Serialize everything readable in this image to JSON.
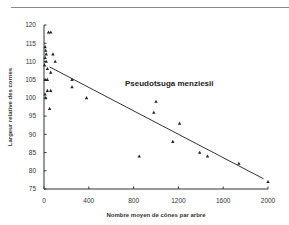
{
  "chart_data": {
    "type": "scatter",
    "title": "Pseudotsuga menziesii",
    "xlabel": "Nombre moyen de cônes par arbre",
    "ylabel": "Largeur relative des cornes",
    "xlim": [
      0,
      2000
    ],
    "ylim": [
      75,
      120
    ],
    "xticks": [
      0,
      400,
      800,
      1200,
      1600,
      2000
    ],
    "yticks": [
      75,
      80,
      85,
      90,
      95,
      100,
      105,
      110,
      115,
      120
    ],
    "grid": false,
    "legend": null,
    "marker": "triangle",
    "points": [
      {
        "x": 40,
        "y": 118
      },
      {
        "x": 60,
        "y": 118
      },
      {
        "x": 10,
        "y": 114
      },
      {
        "x": 15,
        "y": 113
      },
      {
        "x": 20,
        "y": 112
      },
      {
        "x": 10,
        "y": 111
      },
      {
        "x": 20,
        "y": 110
      },
      {
        "x": 5,
        "y": 109
      },
      {
        "x": 80,
        "y": 112
      },
      {
        "x": 100,
        "y": 110
      },
      {
        "x": 30,
        "y": 108
      },
      {
        "x": 60,
        "y": 107
      },
      {
        "x": 10,
        "y": 105
      },
      {
        "x": 30,
        "y": 105
      },
      {
        "x": 30,
        "y": 102
      },
      {
        "x": 60,
        "y": 102
      },
      {
        "x": 10,
        "y": 101
      },
      {
        "x": 15,
        "y": 100
      },
      {
        "x": 50,
        "y": 97
      },
      {
        "x": 250,
        "y": 105
      },
      {
        "x": 250,
        "y": 103
      },
      {
        "x": 380,
        "y": 100
      },
      {
        "x": 850,
        "y": 84
      },
      {
        "x": 980,
        "y": 96
      },
      {
        "x": 1000,
        "y": 99
      },
      {
        "x": 1150,
        "y": 88
      },
      {
        "x": 1210,
        "y": 93
      },
      {
        "x": 1390,
        "y": 85
      },
      {
        "x": 1460,
        "y": 84
      },
      {
        "x": 1740,
        "y": 82
      },
      {
        "x": 2000,
        "y": 77
      }
    ],
    "regression_line": {
      "x1": 50,
      "y1": 108.5,
      "x2": 1960,
      "y2": 77.8
    }
  },
  "labels": {
    "title": "Pseudotsuga menziesii",
    "xlabel": "Nombre moyen de cônes par arbre",
    "ylabel": "Largeur relative des cornes"
  }
}
